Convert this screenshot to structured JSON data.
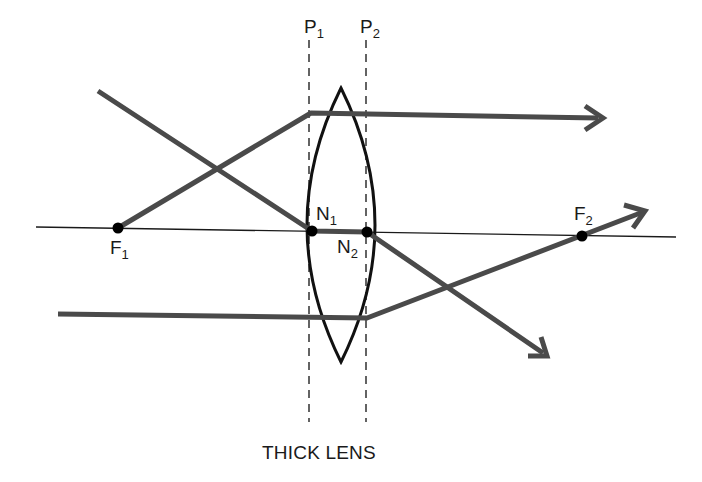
{
  "figure": {
    "caption": "THICK LENS",
    "colors": {
      "ray": "#4a4a4a",
      "lens": "#111111",
      "axis": "#1a1a1a",
      "point": "#000000",
      "background": "#ffffff"
    }
  },
  "labels": {
    "p1": {
      "base": "P",
      "sub": "1"
    },
    "p2": {
      "base": "P",
      "sub": "2"
    },
    "n1": {
      "base": "N",
      "sub": "1"
    },
    "n2": {
      "base": "N",
      "sub": "2"
    },
    "f1": {
      "base": "F",
      "sub": "1"
    },
    "f2": {
      "base": "F",
      "sub": "2"
    }
  },
  "elements": {
    "principal_planes": [
      "P1",
      "P2"
    ],
    "nodal_points": [
      "N1",
      "N2"
    ],
    "focal_points": [
      "F1",
      "F2"
    ],
    "rays": [
      "ray from F1 refracted at P1, exits parallel to axis",
      "ray through N1 and N2, exits parallel to incident direction",
      "ray parallel to axis refracted at P2 through F2"
    ]
  }
}
